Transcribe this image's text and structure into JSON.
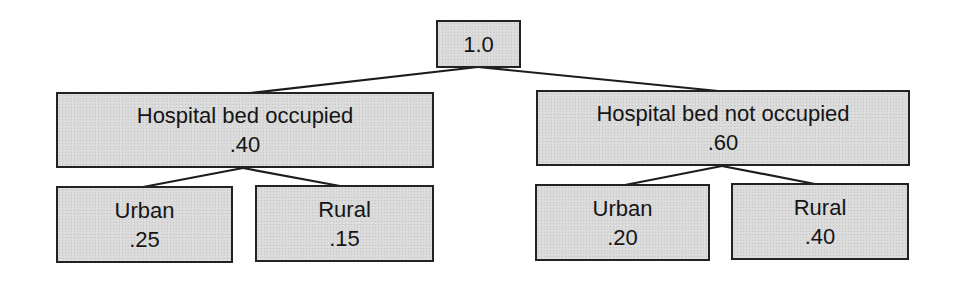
{
  "diagram": {
    "type": "probability-tree",
    "root": {
      "value": "1.0"
    },
    "level1": [
      {
        "label": "Hospital bed occupied",
        "value": ".40",
        "children": [
          {
            "label": "Urban",
            "value": ".25"
          },
          {
            "label": "Rural",
            "value": ".15"
          }
        ]
      },
      {
        "label": "Hospital bed not occupied",
        "value": ".60",
        "children": [
          {
            "label": "Urban",
            "value": ".20"
          },
          {
            "label": "Rural",
            "value": ".40"
          }
        ]
      }
    ]
  },
  "colors": {
    "node_fill": "#dadada",
    "node_border": "#222222",
    "edge": "#1c1c1c",
    "text": "#151515",
    "background": "#ffffff"
  }
}
